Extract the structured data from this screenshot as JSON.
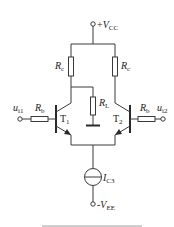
{
  "diagram": {
    "supply_positive": {
      "sign": "+",
      "symbol": "V",
      "subscript": "CC"
    },
    "supply_negative": {
      "sign": "-",
      "symbol": "V",
      "subscript": "EE"
    },
    "resistors": {
      "collector_left": {
        "symbol": "R",
        "subscript": "c"
      },
      "collector_right": {
        "symbol": "R",
        "subscript": "c"
      },
      "base_left": {
        "symbol": "R",
        "subscript": "b"
      },
      "base_right": {
        "symbol": "R",
        "subscript": "b"
      },
      "load": {
        "symbol": "R",
        "subscript": "L"
      }
    },
    "transistors": {
      "left": {
        "symbol": "T",
        "subscript": "1"
      },
      "right": {
        "symbol": "T",
        "subscript": "2"
      }
    },
    "inputs": {
      "left": {
        "symbol": "u",
        "subscript": "i1"
      },
      "right": {
        "symbol": "u",
        "subscript": "i2"
      }
    },
    "current_source": {
      "symbol": "I",
      "subscript": "C3"
    },
    "caption_truncated": "(caption cut off at bottom edge, illegible)"
  },
  "colors": {
    "line": "#3a3a3a",
    "text": "#222222",
    "background": "#ffffff"
  }
}
